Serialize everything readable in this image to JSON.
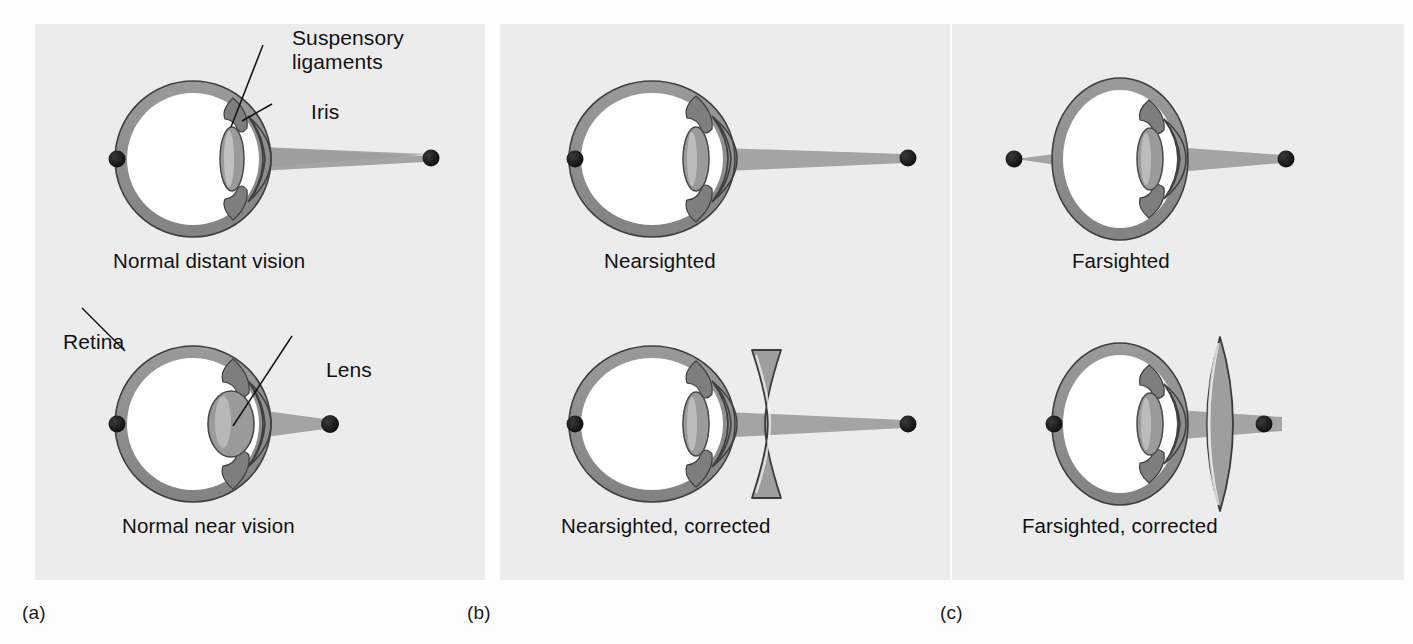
{
  "figure": {
    "background_color": "#fdfdfd",
    "panel_color": "#ececec"
  },
  "colors": {
    "sclera": "#8e8e8e",
    "sclera_outline": "#3f3f3f",
    "vitreous": "#ffffff",
    "lens_fill": "#9a9a9a",
    "lens_outline": "#4a4a4a",
    "light_cone": "#9c9c9c",
    "point_source": "#1a1a1a",
    "corrective_lens_fill": "#9e9e9e",
    "corrective_lens_outline": "#3b3b3b",
    "leader_line": "#111111",
    "text": "#111111"
  },
  "panels": [
    {
      "id": "a",
      "label": "(a)",
      "diagrams": [
        {
          "id": "normal-distant-vision",
          "caption": "Normal distant vision",
          "eye_shape": "round",
          "lens_shape": "thin",
          "corrective_lens": null,
          "object_distance": "far",
          "focus": "on-retina",
          "annotations": [
            {
              "id": "suspensory-ligaments",
              "text": "Suspensory\nligaments",
              "line1": "Suspensory",
              "line2": "ligaments"
            },
            {
              "id": "iris",
              "text": "Iris",
              "line1": "Iris",
              "line2": ""
            }
          ]
        },
        {
          "id": "normal-near-vision",
          "caption": "Normal near vision",
          "eye_shape": "round",
          "lens_shape": "thick",
          "corrective_lens": null,
          "object_distance": "near",
          "focus": "on-retina",
          "annotations": [
            {
              "id": "retina",
              "text": "Retina",
              "line1": "Retina",
              "line2": ""
            },
            {
              "id": "lens",
              "text": "Lens",
              "line1": "Lens",
              "line2": ""
            }
          ]
        }
      ]
    },
    {
      "id": "b",
      "label": "(b)",
      "diagrams": [
        {
          "id": "nearsighted",
          "caption": "Nearsighted",
          "eye_shape": "elongated",
          "lens_shape": "thin",
          "corrective_lens": null,
          "object_distance": "far",
          "focus": "in-front-of-retina",
          "annotations": []
        },
        {
          "id": "nearsighted-corrected",
          "caption": "Nearsighted, corrected",
          "eye_shape": "elongated",
          "lens_shape": "thin",
          "corrective_lens": "concave",
          "object_distance": "far",
          "focus": "on-retina",
          "annotations": []
        }
      ]
    },
    {
      "id": "c",
      "label": "(c)",
      "diagrams": [
        {
          "id": "farsighted",
          "caption": "Farsighted",
          "eye_shape": "shortened",
          "lens_shape": "thin",
          "corrective_lens": null,
          "object_distance": "near",
          "focus": "behind-retina",
          "annotations": []
        },
        {
          "id": "farsighted-corrected",
          "caption": "Farsighted, corrected",
          "eye_shape": "shortened",
          "lens_shape": "thin",
          "corrective_lens": "convex",
          "object_distance": "near",
          "focus": "on-retina",
          "annotations": []
        }
      ]
    }
  ]
}
